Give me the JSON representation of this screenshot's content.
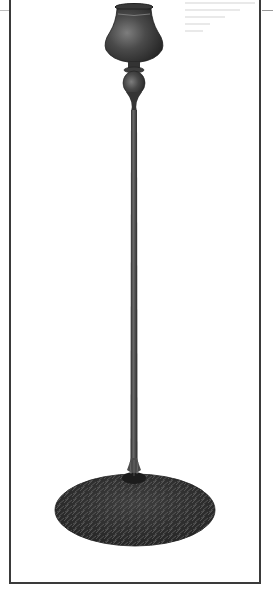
{
  "image": {
    "subject": "bronze candlestick with tall slender stem and textured pine-needle base",
    "alt": "Bronze candlestick photograph",
    "colors": {
      "background": "#ffffff",
      "frame": "#3a3a3a",
      "bronze_dark": "#2b2b2b",
      "bronze_mid": "#4a4a4a",
      "bronze_highlight": "#8a8a8a"
    }
  }
}
